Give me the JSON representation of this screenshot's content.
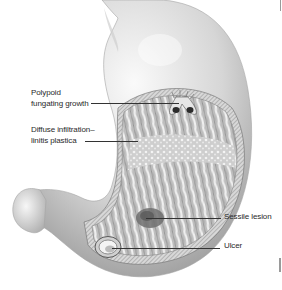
{
  "figure": {
    "labels": [
      {
        "id": "polypoid",
        "lines": [
          "Polypoid",
          "fungating growth"
        ]
      },
      {
        "id": "diffuse",
        "lines": [
          "Diffuse infiltration–",
          "linitis plastica"
        ]
      },
      {
        "id": "sessile",
        "lines": [
          "Sessile lesion"
        ]
      },
      {
        "id": "ulcer",
        "lines": [
          "Ulcer"
        ]
      }
    ]
  },
  "colors": {
    "background": "#ffffff",
    "text": "#2a2a2a",
    "leader": "#333333",
    "organ_light": "#f2f2f2",
    "organ_mid": "#c8c8c8",
    "organ_dark": "#8a8a8a",
    "mucosa": "#b5b5b5"
  }
}
